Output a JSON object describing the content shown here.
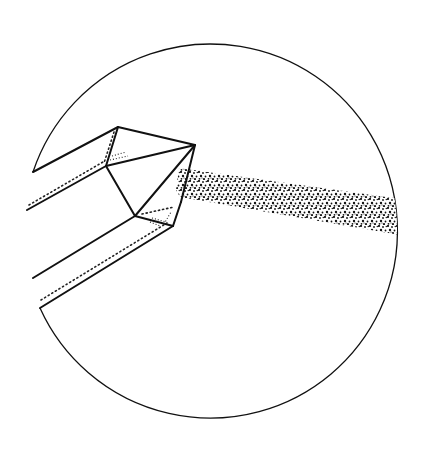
{
  "figure": {
    "colors": {
      "background": "#ffffff",
      "ink": "#111111"
    },
    "field_of_view": {
      "cx": 210,
      "cy": 229,
      "r": 187
    },
    "crystal": {
      "vertices": {
        "top": [
          118,
          127
        ],
        "apex": [
          195,
          145
        ],
        "inner_upper": [
          106,
          166
        ],
        "inner_lower": [
          135,
          216
        ],
        "lower_right": [
          173,
          226
        ],
        "right_edge_top": [
          181,
          202
        ]
      }
    },
    "stippled_band": {
      "left_top": [
        179,
        168
      ],
      "left_bottom": [
        180,
        197
      ],
      "right_top": [
        396,
        198
      ],
      "right_bottom": [
        397,
        234
      ]
    }
  }
}
